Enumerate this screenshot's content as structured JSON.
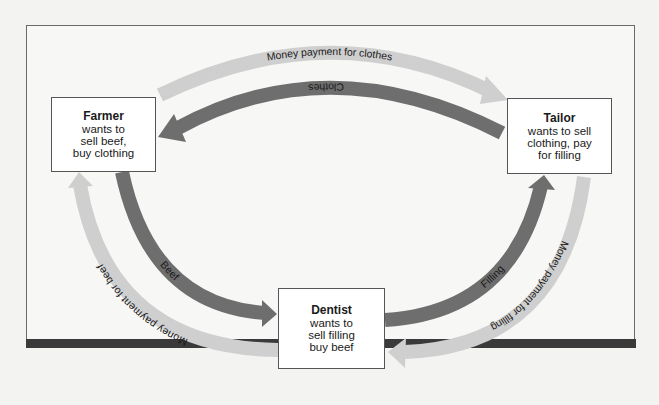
{
  "diagram": {
    "type": "circular-flow-barter",
    "colors": {
      "goods_arrow": "#6e6e6e",
      "money_arrow": "#cfcfcf",
      "bottom_bar": "#3a3a3a",
      "box_border": "#555555"
    },
    "nodes": {
      "farmer": {
        "title": "Farmer",
        "lines": [
          "wants to",
          "sell beef,",
          "buy clothing"
        ]
      },
      "tailor": {
        "title": "Tailor",
        "lines": [
          "wants to sell",
          "clothing, pay",
          "for filling"
        ]
      },
      "dentist": {
        "title": "Dentist",
        "lines": [
          "wants to",
          "sell filling",
          "buy beef"
        ]
      }
    },
    "flows": {
      "money_for_clothes": {
        "label": "Money payment for clothes",
        "from": "Farmer",
        "to": "Tailor",
        "kind": "money"
      },
      "clothes": {
        "label": "Clothes",
        "from": "Tailor",
        "to": "Farmer",
        "kind": "goods"
      },
      "beef": {
        "label": "Beef",
        "from": "Farmer",
        "to": "Dentist",
        "kind": "goods"
      },
      "money_for_beef": {
        "label": "Money payment for beef",
        "from": "Dentist",
        "to": "Farmer",
        "kind": "money"
      },
      "filling": {
        "label": "Filling",
        "from": "Dentist",
        "to": "Tailor",
        "kind": "goods"
      },
      "money_for_filling": {
        "label": "Money payment for filling",
        "from": "Tailor",
        "to": "Dentist",
        "kind": "money"
      }
    }
  }
}
